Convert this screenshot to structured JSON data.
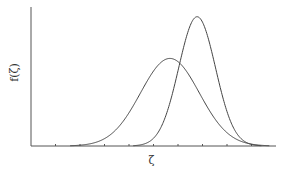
{
  "chart_data": {
    "type": "line",
    "title": "",
    "xlabel": "ζ",
    "ylabel": "f(ζ)",
    "xlim": [
      0,
      10
    ],
    "ylim": [
      0,
      1.0
    ],
    "x_ticks": [
      1,
      2,
      3,
      4,
      5,
      6,
      7,
      8,
      9
    ],
    "x_tick_labels": [],
    "y_ticks": [],
    "grid": false,
    "legend": null,
    "series": [
      {
        "name": "distribution-wide",
        "kind": "gaussian",
        "mean": 5.67,
        "sigma": 1.2,
        "peak": 0.63
      },
      {
        "name": "distribution-narrow",
        "kind": "gaussian",
        "mean": 6.78,
        "sigma": 0.75,
        "peak": 0.93
      }
    ]
  }
}
